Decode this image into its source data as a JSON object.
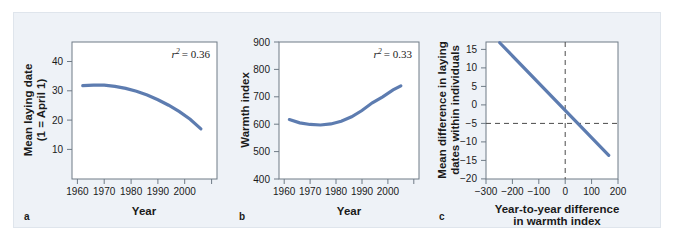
{
  "figure": {
    "background_color": "#eef2f7",
    "line_color": "#5d7cb0",
    "axis_color": "#6f7b86"
  },
  "panels": [
    {
      "letter": "a",
      "xlabel": "Year",
      "ylabel_line1": "Mean laying date",
      "ylabel_line2": "(1 = April 1)",
      "annotation_symbol": "r",
      "annotation_exponent": "2",
      "annotation_value": "= 0.36"
    },
    {
      "letter": "b",
      "xlabel": "Year",
      "ylabel_line1": "Warmth index",
      "ylabel_line2": "",
      "annotation_symbol": "r",
      "annotation_exponent": "2",
      "annotation_value": "= 0.33"
    },
    {
      "letter": "c",
      "xlabel_line1": "Year-to-year difference",
      "xlabel_line2": "in warmth index",
      "ylabel_line1": "Mean difference in laying",
      "ylabel_line2": "dates within individuals"
    }
  ],
  "chart_data": [
    {
      "type": "line",
      "panel": "a",
      "title": "",
      "xlabel": "Year",
      "ylabel": "Mean laying date (1 = April 1)",
      "xlim": [
        1958,
        2012
      ],
      "ylim": [
        0,
        47
      ],
      "xticks": [
        1960,
        1970,
        1980,
        1990,
        2000,
        2010
      ],
      "xtick_labels": [
        "1960",
        "1970",
        "1980",
        "1990",
        "2000",
        ""
      ],
      "yticks": [
        10,
        20,
        30,
        40
      ],
      "ytick_labels": [
        "10",
        "20",
        "30",
        "40"
      ],
      "grid": false,
      "annotation": "r2 = 0.36",
      "series": [
        {
          "name": "mean laying date fit",
          "x": [
            1962,
            1966,
            1970,
            1974,
            1978,
            1982,
            1986,
            1990,
            1994,
            1998,
            2002,
            2006
          ],
          "y": [
            32.0,
            32.2,
            32.2,
            31.8,
            31.1,
            30.1,
            28.8,
            27.2,
            25.3,
            23.1,
            20.5,
            17.2
          ]
        }
      ]
    },
    {
      "type": "line",
      "panel": "b",
      "title": "",
      "xlabel": "Year",
      "ylabel": "Warmth index",
      "xlim": [
        1958,
        2012
      ],
      "ylim": [
        400,
        900
      ],
      "xticks": [
        1960,
        1970,
        1980,
        1990,
        2000,
        2010
      ],
      "xtick_labels": [
        "1960",
        "1970",
        "1980",
        "1990",
        "2000",
        ""
      ],
      "yticks": [
        400,
        500,
        600,
        700,
        800,
        900
      ],
      "ytick_labels": [
        "400",
        "500",
        "600",
        "700",
        "800",
        "900"
      ],
      "grid": false,
      "annotation": "r2 = 0.33",
      "series": [
        {
          "name": "warmth index fit",
          "x": [
            1962,
            1966,
            1970,
            1974,
            1978,
            1982,
            1986,
            1990,
            1994,
            1998,
            2002,
            2005
          ],
          "y": [
            617,
            605,
            599,
            597,
            601,
            611,
            627,
            650,
            678,
            700,
            725,
            740
          ]
        }
      ]
    },
    {
      "type": "line",
      "panel": "c",
      "title": "",
      "xlabel": "Year-to-year difference in warmth index",
      "ylabel": "Mean difference in laying dates within individuals",
      "xlim": [
        -300,
        200
      ],
      "ylim": [
        -20,
        17
      ],
      "xticks": [
        -300,
        -200,
        -100,
        0,
        100,
        200
      ],
      "xtick_labels": [
        "−300",
        "−200",
        "−100",
        "0",
        "100",
        "200"
      ],
      "yticks": [
        -20,
        -15,
        -10,
        -5,
        0,
        5,
        10,
        15
      ],
      "ytick_labels": [
        "−20",
        "−15",
        "−10",
        "−5",
        "0",
        "5",
        "10",
        "15"
      ],
      "grid": false,
      "reference_lines": [
        {
          "axis": "x",
          "value": 0,
          "style": "dashed"
        },
        {
          "axis": "y",
          "value": 0,
          "style": "dashed"
        }
      ],
      "series": [
        {
          "name": "regression line",
          "x": [
            -248,
            165
          ],
          "y": [
            16.8,
            -13.6
          ]
        }
      ]
    }
  ]
}
